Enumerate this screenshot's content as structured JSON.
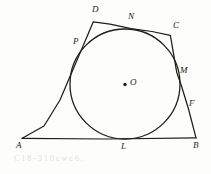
{
  "figure": {
    "background_color": "#fdfdfc",
    "ink_color": "#201d1c",
    "labels": {
      "A": "A",
      "B": "B",
      "C": "C",
      "D": "D",
      "L": "L",
      "M": "M",
      "N": "N",
      "P": "P",
      "O": "O",
      "F": "F"
    },
    "vertices": [
      {
        "name": "A",
        "label": "A",
        "x": 22,
        "y": 138,
        "label_x": 17,
        "label_y": 142
      },
      {
        "name": "B",
        "label": "B",
        "x": 196,
        "y": 138,
        "label_x": 194,
        "label_y": 142
      },
      {
        "name": "C",
        "label": "C",
        "x": 170,
        "y": 35,
        "label_x": 175,
        "label_y": 23
      },
      {
        "name": "D",
        "label": "D",
        "x": 93,
        "y": 22,
        "label_x": 93,
        "label_y": 7
      }
    ],
    "tangent_points": [
      {
        "name": "L",
        "label": "L",
        "x": 125,
        "y": 139,
        "label_x": 122,
        "label_y": 143
      },
      {
        "name": "M",
        "label": "M",
        "x": 177,
        "y": 73,
        "label_x": 181,
        "label_y": 68
      },
      {
        "name": "N",
        "label": "N",
        "x": 131,
        "y": 29,
        "label_x": 130,
        "label_y": 14
      },
      {
        "name": "P",
        "label": "P",
        "x": 84,
        "y": 43,
        "label_x": 74,
        "label_y": 39
      }
    ],
    "circle": {
      "name": "incircle",
      "center_x": 125,
      "center_y": 84,
      "radius": 55,
      "center_label": "O",
      "center_label_x": 131,
      "center_label_y": 79,
      "center_dot_radius": 1.6
    },
    "segment_labels": [
      {
        "name": "F",
        "label": "F",
        "x": 190,
        "y": 100
      }
    ],
    "sides": [
      {
        "name": "side-AB",
        "from": "A",
        "to": "B"
      },
      {
        "name": "side-BC",
        "from": "B",
        "to": "C"
      },
      {
        "name": "side-CD",
        "from": "C",
        "to": "D"
      },
      {
        "name": "side-DA",
        "from": "D",
        "to": "A"
      }
    ],
    "scan_noise": [
      {
        "text": "C 1 8 - 3 1 0  c  w  c  6  .",
        "x": 14,
        "y": 158
      }
    ]
  }
}
